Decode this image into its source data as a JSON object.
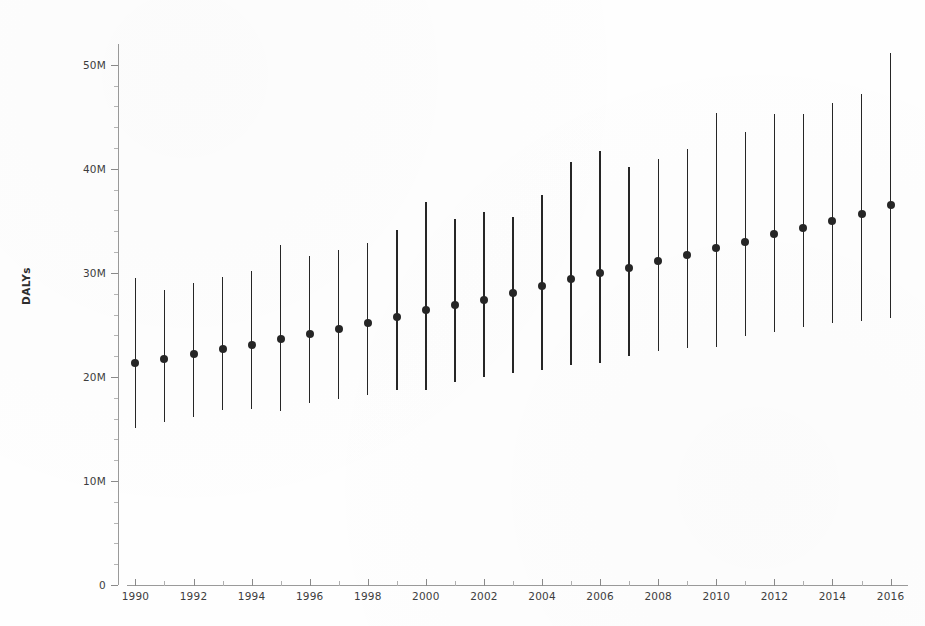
{
  "chart_data": {
    "type": "scatter",
    "title": "",
    "subtitle": "",
    "xlabel": "",
    "ylabel": "DALYs",
    "xlim": [
      1989.4,
      2016.6
    ],
    "ylim": [
      0,
      52000000
    ],
    "grid": false,
    "legend": null,
    "error_bars": "vertical uncertainty interval",
    "y_tick_labels": [
      "0",
      "10M",
      "20M",
      "30M",
      "40M",
      "50M"
    ],
    "y_tick_values": [
      0,
      10000000,
      20000000,
      30000000,
      40000000,
      50000000
    ],
    "x_tick_labels": [
      "1990",
      "1992",
      "1994",
      "1996",
      "1998",
      "2000",
      "2002",
      "2004",
      "2006",
      "2008",
      "2010",
      "2012",
      "2014",
      "2016"
    ],
    "x_tick_values": [
      1990,
      1992,
      1994,
      1996,
      1998,
      2000,
      2002,
      2004,
      2006,
      2008,
      2010,
      2012,
      2014,
      2016
    ],
    "x_minor_ticks": [
      1991,
      1993,
      1995,
      1997,
      1999,
      2001,
      2003,
      2005,
      2007,
      2009,
      2011,
      2013,
      2015
    ],
    "categories": [
      1990,
      1991,
      1992,
      1993,
      1994,
      1995,
      1996,
      1997,
      1998,
      1999,
      2000,
      2001,
      2002,
      2003,
      2004,
      2005,
      2006,
      2007,
      2008,
      2009,
      2010,
      2011,
      2012,
      2013,
      2014,
      2015,
      2016
    ],
    "values": [
      21300000,
      21700000,
      22200000,
      22700000,
      23100000,
      23600000,
      24100000,
      24600000,
      25200000,
      25800000,
      26400000,
      26900000,
      27400000,
      28100000,
      28700000,
      29400000,
      30000000,
      30500000,
      31100000,
      31700000,
      32400000,
      33000000,
      33700000,
      34300000,
      35000000,
      35700000,
      36500000
    ],
    "lower": [
      15100000,
      15700000,
      16100000,
      16800000,
      16900000,
      16700000,
      17500000,
      17900000,
      18300000,
      18700000,
      18700000,
      19500000,
      20000000,
      20400000,
      20700000,
      21100000,
      21300000,
      22000000,
      22500000,
      22800000,
      22900000,
      23900000,
      24300000,
      24800000,
      25200000,
      25400000,
      25700000
    ],
    "upper": [
      29500000,
      28400000,
      29000000,
      29600000,
      30200000,
      32700000,
      31600000,
      32200000,
      32900000,
      34100000,
      36800000,
      35200000,
      35900000,
      35400000,
      37500000,
      40700000,
      41700000,
      40200000,
      40900000,
      41900000,
      45400000,
      43500000,
      45300000,
      45300000,
      46300000,
      47200000,
      51100000
    ],
    "series": [
      {
        "name": "DALYs point estimate",
        "marker": "filled circle",
        "color": "#262626"
      }
    ]
  },
  "axes": {
    "y_title": "DALYs"
  },
  "caption": {
    "bleed_text": ""
  }
}
